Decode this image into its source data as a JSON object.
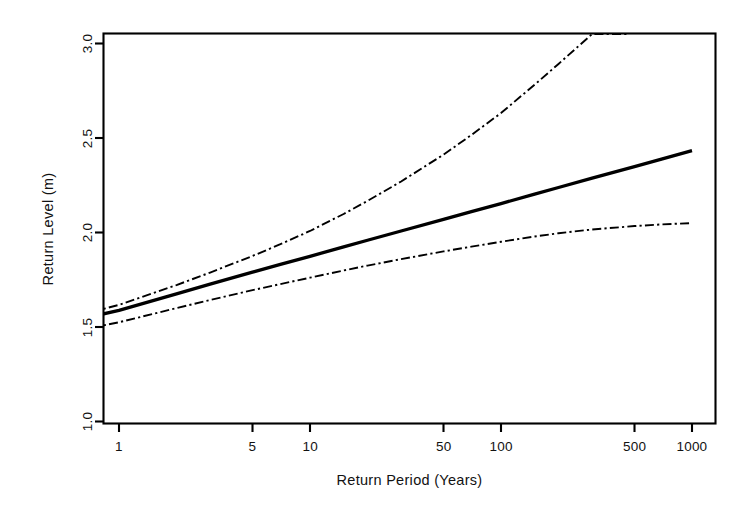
{
  "figure": {
    "background_color": "#ffffff",
    "line_color": "#000000",
    "frame_color": "#000000"
  },
  "chart_data": {
    "type": "line",
    "title": "",
    "subtitle": "",
    "xlabel": "Return Period (Years)",
    "ylabel": "Return Level (m)",
    "xscale": "log",
    "yscale": "linear",
    "xlim": [
      0.7,
      1260
    ],
    "ylim": [
      0.88,
      3.05
    ],
    "grid": false,
    "legend": "none",
    "xticks": [
      1,
      5,
      10,
      50,
      100,
      500,
      1000
    ],
    "xticklabels": [
      "1",
      "5",
      "10",
      "50",
      "100",
      "500",
      "1000"
    ],
    "yticks": [
      1.0,
      1.5,
      2.0,
      2.5,
      3.0
    ],
    "yticklabels": [
      "1.0",
      "1.5",
      "2.0",
      "2.5",
      "3.0"
    ],
    "series": [
      {
        "name": "Return level estimate",
        "style": "solid",
        "x": [
          0.72,
          1,
          2,
          3,
          5,
          7,
          10,
          15,
          20,
          30,
          50,
          70,
          100,
          150,
          200,
          300,
          500,
          700,
          1000
        ],
        "values": [
          1.555,
          1.588,
          1.675,
          1.727,
          1.79,
          1.831,
          1.874,
          1.924,
          1.959,
          2.008,
          2.069,
          2.11,
          2.153,
          2.203,
          2.238,
          2.288,
          2.349,
          2.39,
          2.433
        ]
      },
      {
        "name": "95% upper confidence limit",
        "style": "dashdot",
        "x": [
          0.72,
          1,
          2,
          3,
          5,
          7,
          10,
          15,
          20,
          30,
          50,
          70,
          100,
          150,
          200,
          300,
          464
        ],
        "values": [
          1.58,
          1.617,
          1.722,
          1.788,
          1.876,
          1.938,
          2.008,
          2.098,
          2.167,
          2.27,
          2.412,
          2.516,
          2.632,
          2.782,
          2.892,
          3.05,
          3.05
        ]
      },
      {
        "name": "95% lower confidence limit",
        "style": "dashdot",
        "x": [
          0.72,
          1,
          2,
          3,
          5,
          7,
          10,
          15,
          20,
          30,
          50,
          70,
          100,
          150,
          200,
          300,
          500,
          700,
          1000
        ],
        "values": [
          1.497,
          1.525,
          1.6,
          1.643,
          1.695,
          1.727,
          1.761,
          1.799,
          1.825,
          1.859,
          1.9,
          1.925,
          1.951,
          1.979,
          1.996,
          2.016,
          2.034,
          2.043,
          2.05
        ]
      }
    ],
    "annotations": []
  }
}
